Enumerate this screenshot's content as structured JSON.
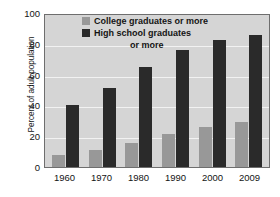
{
  "chart_data": {
    "type": "bar",
    "title": "",
    "subtitle": "",
    "xlabel": "",
    "ylabel": "Percent of adult population",
    "categories": [
      "1960",
      "1970",
      "1980",
      "1990",
      "2000",
      "2009"
    ],
    "series": [
      {
        "name": "College graduates or more",
        "color": "#989898",
        "values": [
          8,
          11,
          16,
          21.5,
          26,
          29.5
        ]
      },
      {
        "name": "High school graduates or more",
        "color": "#2a2a2a",
        "values": [
          41,
          52,
          66,
          77,
          83.5,
          87
        ]
      }
    ],
    "ylim": [
      0,
      100
    ],
    "yticks": [
      "0",
      "20",
      "40",
      "60",
      "80",
      "100"
    ],
    "ytick_values": [
      0,
      20,
      40,
      60,
      80,
      100
    ],
    "grid": true,
    "grid_color": "#f2f2f2",
    "legend_position": "top-center",
    "plot_background": "#d5d5d5",
    "figure_background": "#ffffff",
    "axis_color": "#6e6e6e"
  },
  "legend": {
    "entries": [
      {
        "label": "College graduates or more",
        "swatch": "#989898"
      },
      {
        "label": "High school graduates",
        "swatch": "#2a2a2a"
      }
    ],
    "wrap_line": "or more"
  }
}
